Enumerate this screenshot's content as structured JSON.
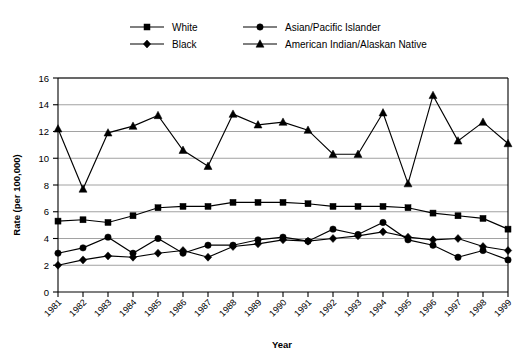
{
  "chart_data": {
    "type": "line",
    "title": "",
    "xlabel": "Year",
    "ylabel": "Rate (per 100,000)",
    "x": [
      1981,
      1982,
      1983,
      1984,
      1985,
      1986,
      1987,
      1988,
      1989,
      1990,
      1991,
      1992,
      1993,
      1994,
      1995,
      1996,
      1997,
      1998,
      1999
    ],
    "categories": [
      "1981",
      "1982",
      "1983",
      "1984",
      "1985",
      "1986",
      "1987",
      "1988",
      "1989",
      "1990",
      "1991",
      "1992",
      "1993",
      "1994",
      "1995",
      "1996",
      "1997",
      "1998",
      "1999"
    ],
    "xlim": [
      1981,
      1999
    ],
    "ylim": [
      0,
      16
    ],
    "yticks": [
      0,
      2,
      4,
      6,
      8,
      10,
      12,
      14,
      16
    ],
    "grid": true,
    "legend_position": "top",
    "series": [
      {
        "name": "White",
        "marker": "square",
        "values": [
          5.3,
          5.4,
          5.2,
          5.7,
          6.3,
          6.4,
          6.4,
          6.7,
          6.7,
          6.7,
          6.6,
          6.4,
          6.4,
          6.4,
          6.3,
          5.9,
          5.7,
          5.5,
          4.7
        ]
      },
      {
        "name": "Black",
        "marker": "diamond",
        "values": [
          2.0,
          2.4,
          2.7,
          2.6,
          2.9,
          3.1,
          2.6,
          3.4,
          3.6,
          3.9,
          3.8,
          4.0,
          4.2,
          4.5,
          4.1,
          3.9,
          4.0,
          3.4,
          3.1
        ]
      },
      {
        "name": "Asian/Pacific Islander",
        "marker": "circle",
        "values": [
          2.9,
          3.3,
          4.1,
          2.9,
          4.0,
          2.9,
          3.5,
          3.5,
          3.9,
          4.1,
          3.8,
          4.7,
          4.3,
          5.2,
          3.9,
          3.5,
          2.6,
          3.1,
          2.4
        ]
      },
      {
        "name": "American Indian/Alaskan Native",
        "marker": "triangle",
        "values": [
          12.2,
          7.7,
          11.9,
          12.4,
          13.2,
          10.6,
          9.4,
          13.3,
          12.5,
          12.7,
          12.1,
          10.3,
          10.3,
          13.4,
          8.1,
          14.7,
          11.3,
          12.7,
          11.1
        ]
      }
    ]
  },
  "legend": {
    "entries": [
      {
        "label": "White",
        "marker": "square"
      },
      {
        "label": "Asian/Pacific Islander",
        "marker": "circle"
      },
      {
        "label": "Black",
        "marker": "diamond"
      },
      {
        "label": "American Indian/Alaskan Native",
        "marker": "triangle"
      }
    ]
  },
  "axes": {
    "y_title": "Rate (per 100,000)",
    "x_title": "Year"
  },
  "colors": {
    "ink": "#000000",
    "grid": "#8a8a8a",
    "background": "#ffffff"
  }
}
